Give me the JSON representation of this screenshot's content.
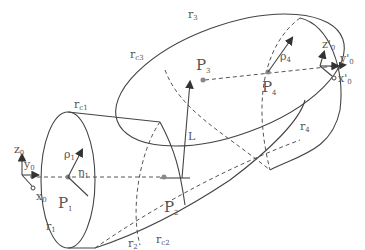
{
  "diagram": {
    "type": "swept-tube geometry",
    "points": [
      {
        "id": "P1",
        "label": "P",
        "sub": "1"
      },
      {
        "id": "P2",
        "label": "P",
        "sub": "2"
      },
      {
        "id": "P3",
        "label": "P",
        "sub": "3"
      },
      {
        "id": "P4",
        "label": "P",
        "sub": "4"
      }
    ],
    "curves": [
      {
        "id": "r1",
        "label": "r",
        "sub": "1"
      },
      {
        "id": "r2",
        "label": "r",
        "sub": "2"
      },
      {
        "id": "r3",
        "label": "r",
        "sub": "3"
      },
      {
        "id": "r4",
        "label": "r",
        "sub": "4"
      },
      {
        "id": "rc1",
        "label": "r",
        "sub": "c1"
      },
      {
        "id": "rc2",
        "label": "r",
        "sub": "c2"
      },
      {
        "id": "rc3",
        "label": "r",
        "sub": "c3"
      }
    ],
    "radii": [
      {
        "id": "rho1",
        "label": "ρ",
        "sub": "1"
      },
      {
        "id": "rho4",
        "label": "ρ",
        "sub": "4"
      }
    ],
    "angle": {
      "label": "η",
      "sub": "1"
    },
    "length_label": "L",
    "frame_start": {
      "z": "z",
      "y": "y",
      "x": "x",
      "sub": "0"
    },
    "frame_end": {
      "z": "z'",
      "y": "y'",
      "x": "x'",
      "sub": "0"
    }
  }
}
